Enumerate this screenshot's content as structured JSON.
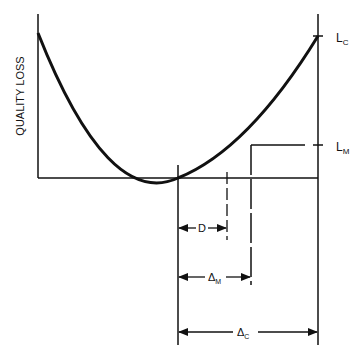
{
  "diagram": {
    "y_axis_label": "QUALITY LOSS",
    "levels": {
      "lc": {
        "main": "L",
        "sub": "C"
      },
      "lm": {
        "main": "L",
        "sub": "M"
      }
    },
    "dimensions": {
      "d": {
        "label": "D"
      },
      "delta_m": {
        "main": "Δ",
        "sub": "M"
      },
      "delta_c": {
        "main": "Δ",
        "sub": "C"
      }
    },
    "colors": {
      "ink": "#111111",
      "background": "#ffffff"
    }
  }
}
